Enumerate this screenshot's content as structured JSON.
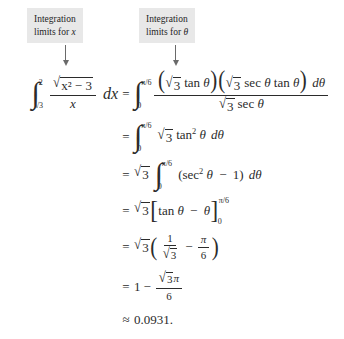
{
  "figure": {
    "type": "worked-integral-trig-substitution",
    "background_color": "#ffffff",
    "text_color": "#2b2b2b"
  },
  "callouts": [
    {
      "id": "callout-x",
      "line1": "Integration",
      "line2_prefix": "limits for",
      "line2_var": "x",
      "background_color": "#e8e8e8"
    },
    {
      "id": "callout-theta",
      "line1": "Integration",
      "line2_prefix": "limits for",
      "line2_var": "θ",
      "background_color": "#e8e8e8"
    }
  ],
  "arrows": [
    {
      "id": "arrow-x",
      "direction": "down",
      "color": "#6a6a6a"
    },
    {
      "id": "arrow-theta",
      "direction": "down",
      "color": "#6a6a6a"
    }
  ],
  "equation": {
    "line1": {
      "relation": "",
      "lhs": {
        "integral_lower": "√3",
        "integral_upper": "2",
        "numerator_radicand": "x² − 3",
        "denominator": "x",
        "differential": "dx"
      },
      "rhs": {
        "integral_lower": "0",
        "integral_upper": "π/6",
        "numerator": "(√3 tan θ)(√3 sec θ tan θ) dθ",
        "denominator": "√3 sec θ"
      }
    },
    "line2": {
      "relation": "=",
      "integral_lower": "0",
      "integral_upper": "π/6",
      "body": "√3 tan² θ dθ"
    },
    "line3": {
      "relation": "=",
      "coefficient": "√3",
      "integral_lower": "0",
      "integral_upper": "π/6",
      "body": "(sec² θ − 1) dθ"
    },
    "line4": {
      "relation": "=",
      "coefficient": "√3",
      "bracket_body": "tan θ − θ",
      "eval_lower": "0",
      "eval_upper": "π/6"
    },
    "line5": {
      "relation": "=",
      "coefficient": "√3",
      "term1_numerator": "1",
      "term1_denominator": "√3",
      "operator": "−",
      "term2_numerator": "π",
      "term2_denominator": "6"
    },
    "line6": {
      "relation": "=",
      "leading_term": "1",
      "operator": "−",
      "fraction_numerator": "√3π",
      "fraction_denominator": "6"
    },
    "line7": {
      "relation": "≈",
      "value": "0.0931."
    }
  },
  "symbols": {
    "integral": "∫",
    "radical": "√",
    "theta": "θ",
    "pi": "π",
    "minus": "−",
    "approx": "≈",
    "equals": "=",
    "paren_left": "(",
    "paren_right": ")",
    "bracket_left": "[",
    "bracket_right": "]",
    "superscript_two": "2",
    "dtheta": "dθ",
    "dx": "dx",
    "tan": "tan",
    "sec": "sec"
  }
}
